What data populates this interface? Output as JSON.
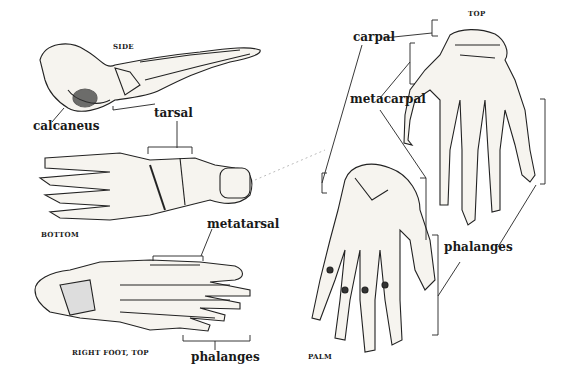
{
  "figure": {
    "foot": {
      "views": {
        "side": "SIDE",
        "bottom": "BOTTOM",
        "top": "RIGHT FOOT, TOP"
      },
      "labels": {
        "calcaneus": "calcaneus",
        "tarsal": "tarsal",
        "metatarsal": "metatarsal",
        "phalanges": "phalanges"
      }
    },
    "hand": {
      "views": {
        "top": "TOP",
        "palm": "PALM"
      },
      "labels": {
        "carpal": "carpal",
        "metacarpal": "metacarpal",
        "phalanges": "phalanges"
      }
    }
  }
}
